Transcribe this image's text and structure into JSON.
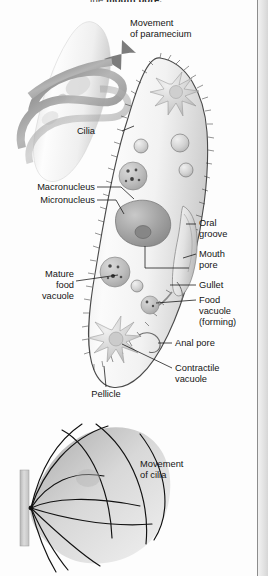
{
  "figure": {
    "running_head": "the mouth pore.",
    "running_head_lead": "the ",
    "running_head_bold": "mouth pore.",
    "type": "labeled biological diagram",
    "subject": "Paramecium",
    "panels": [
      {
        "id": "top",
        "name": "paramecium-movement-panel"
      },
      {
        "id": "main",
        "name": "paramecium-anatomy-panel"
      },
      {
        "id": "bottom",
        "name": "cilia-beat-panel"
      }
    ]
  },
  "labels": {
    "movement_of_paramecium": {
      "line1": "Movement",
      "line2": "of paramecium"
    },
    "cilia": "Cilia",
    "macronucleus": "Macronucleus",
    "micronucleus": "Micronucleus",
    "oral_groove": {
      "line1": "Oral",
      "line2": "groove"
    },
    "mouth_pore": {
      "line1": "Mouth",
      "line2": "pore"
    },
    "gullet": "Gullet",
    "food_vacuole_forming": {
      "line1": "Food",
      "line2": "vacuole",
      "line3": "(forming)"
    },
    "mature_food_vacuole": {
      "line1": "Mature",
      "line2": "food",
      "line3": "vacuole"
    },
    "anal_pore": "Anal pore",
    "contractile_vacuole": {
      "line1": "Contractile",
      "line2": "vacuole"
    },
    "pellicle": "Pellicle",
    "movement_of_cilia": {
      "line1": "Movement",
      "line2": "of cilia"
    }
  },
  "colors": {
    "page_background": "#fdfdfd",
    "cell_fill": "#f4f4f4",
    "cell_outline": "#4a4a4a",
    "organelle_dark": "#9a9a9a",
    "organelle_mid": "#c6c6c6",
    "organelle_light": "#e0e0e0",
    "arrow_ribbon": "#8e8e8e",
    "leader_line": "#111111",
    "label_text": "#151515",
    "cilia_stroke": "#2b2b2b",
    "wall": "#c9c9c9",
    "gutter": "#e3e3e3"
  },
  "structures": [
    {
      "name": "cilia",
      "description": "hair-like projections covering the pellicle"
    },
    {
      "name": "pellicle",
      "description": "flexible outer covering of the cell"
    },
    {
      "name": "macronucleus",
      "description": "large kidney-shaped nucleus controlling metabolism"
    },
    {
      "name": "micronucleus",
      "description": "small nucleus involved in reproduction"
    },
    {
      "name": "oral groove",
      "description": "ciliated channel directing food to the mouth pore"
    },
    {
      "name": "mouth pore",
      "description": "opening at the base of the oral groove"
    },
    {
      "name": "gullet",
      "description": "tube through which food passes into the cytoplasm"
    },
    {
      "name": "food vacuole (forming)",
      "description": "vacuole budding from the gullet"
    },
    {
      "name": "mature food vacuole",
      "description": "vacuole in which digestion occurs"
    },
    {
      "name": "anal pore",
      "description": "site where waste is expelled"
    },
    {
      "name": "contractile vacuole",
      "description": "star-shaped organelle expelling excess water"
    }
  ]
}
